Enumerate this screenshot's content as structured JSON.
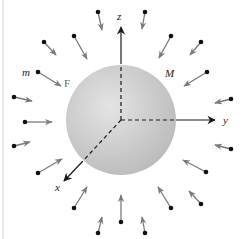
{
  "figure": {
    "background": "#ffffff",
    "border_color": "#bdbdbd",
    "sphere": {
      "label": "M",
      "cx": 121,
      "cy": 120,
      "r": 55,
      "color_light": "#e4e4e4",
      "color_dark": "#bcbcbc"
    },
    "origin": {
      "x": 121,
      "y": 120
    },
    "axes": [
      {
        "name": "z",
        "label": "z",
        "dashed_to": [
          121,
          64
        ],
        "tip": [
          121,
          27
        ],
        "label_pos": [
          117,
          20
        ]
      },
      {
        "name": "y",
        "label": "y",
        "dashed_to": [
          176,
          120
        ],
        "tip": [
          215,
          120
        ],
        "label_pos": [
          223,
          124
        ]
      },
      {
        "name": "x",
        "label": "x",
        "dashed_to": [
          82,
          162
        ],
        "tip": [
          64,
          181
        ],
        "label_pos": [
          55,
          191
        ]
      }
    ],
    "labels": {
      "test_mass": {
        "text": "m",
        "x": 22,
        "y": 76
      },
      "force": {
        "text": "F",
        "x": 64,
        "y": 87
      },
      "sphere_mass": {
        "text": "M",
        "x": 165,
        "y": 77
      }
    },
    "particle_color": "#111111",
    "force_arrow_color": "#7a7a7a",
    "axis_color": "#1a1a1a",
    "particles": [
      {
        "dot": [
          98,
          12
        ],
        "tip": [
          102,
          30
        ]
      },
      {
        "dot": [
          145,
          12
        ],
        "tip": [
          142,
          29
        ]
      },
      {
        "dot": [
          74,
          36
        ],
        "tip": [
          87,
          59
        ]
      },
      {
        "dot": [
          44,
          42
        ],
        "tip": [
          56,
          55
        ]
      },
      {
        "dot": [
          171,
          36
        ],
        "tip": [
          159,
          58
        ]
      },
      {
        "dot": [
          201,
          42
        ],
        "tip": [
          190,
          55
        ]
      },
      {
        "dot": [
          38,
          72
        ],
        "tip": [
          61,
          86
        ]
      },
      {
        "dot": [
          207,
          72
        ],
        "tip": [
          184,
          86
        ]
      },
      {
        "dot": [
          14,
          97
        ],
        "tip": [
          32,
          101
        ]
      },
      {
        "dot": [
          231,
          99
        ],
        "tip": [
          215,
          103
        ]
      },
      {
        "dot": [
          25,
          122
        ],
        "tip": [
          52,
          122
        ]
      },
      {
        "dot": [
          14,
          146
        ],
        "tip": [
          30,
          142
        ]
      },
      {
        "dot": [
          231,
          149
        ],
        "tip": [
          215,
          145
        ]
      },
      {
        "dot": [
          38,
          173
        ],
        "tip": [
          62,
          159
        ]
      },
      {
        "dot": [
          206,
          172
        ],
        "tip": [
          183,
          160
        ]
      },
      {
        "dot": [
          74,
          208
        ],
        "tip": [
          87,
          187
        ]
      },
      {
        "dot": [
          171,
          208
        ],
        "tip": [
          158,
          187
        ]
      },
      {
        "dot": [
          201,
          204
        ],
        "tip": [
          189,
          191
        ]
      },
      {
        "dot": [
          98,
          233
        ],
        "tip": [
          102,
          217
        ]
      },
      {
        "dot": [
          121,
          222
        ],
        "tip": [
          121,
          195
        ]
      },
      {
        "dot": [
          145,
          233
        ],
        "tip": [
          142,
          217
        ]
      }
    ]
  }
}
